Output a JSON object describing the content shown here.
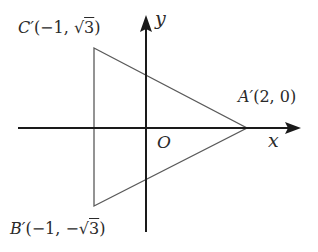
{
  "diagram": {
    "type": "coordinate-plane-triangle",
    "axes": {
      "x_label": "x",
      "y_label": "y",
      "origin_label": "O"
    },
    "points": [
      {
        "id": "C",
        "name": "C′",
        "coords": "(−1, √3)",
        "px": [
          94,
          48
        ]
      },
      {
        "id": "B",
        "name": "B′",
        "coords": "(−1, −√3)",
        "px": [
          94,
          206
        ]
      },
      {
        "id": "A",
        "name": "A′",
        "coords": "(2, 0)",
        "px": [
          247,
          128
        ]
      }
    ],
    "labels": {
      "C": {
        "name": "C′",
        "open": "(−1, ",
        "radical": "√",
        "radicand": "3",
        "close": ")"
      },
      "B": {
        "name": "B′",
        "open": "(−1, −",
        "radical": "√",
        "radicand": "3",
        "close": ")"
      },
      "A": {
        "name": "A′",
        "coords": "(2, 0)"
      }
    },
    "colors": {
      "axis": "#1a1a1a",
      "triangle": "#555555",
      "text": "#2a2a2a",
      "background": "#ffffff"
    }
  }
}
